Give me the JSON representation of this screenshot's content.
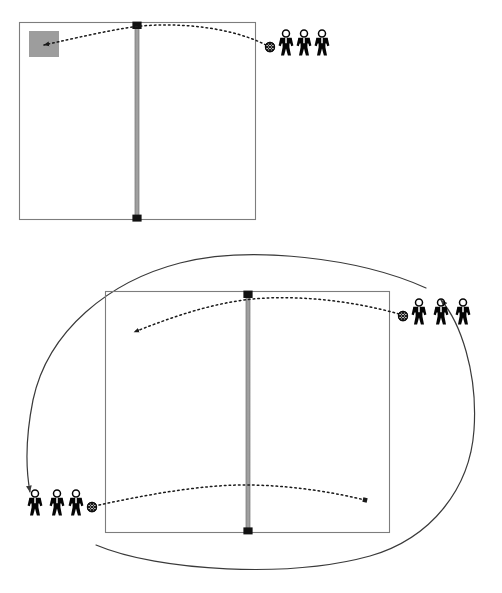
{
  "document": {
    "type": "sports-drill-diagram",
    "sport": "volleyball",
    "title_fragment_top": "",
    "caption_fragment_bottom": ""
  },
  "palette": {
    "court_line": "#7d7d7d",
    "net_band": "#9a9a9a",
    "net_post": "#111111",
    "target_zone": "#9d9d9d",
    "trajectory": "#1a1a1a",
    "rotation_arrow": "#3a3a3a",
    "figure": "#050505",
    "background": "#ffffff"
  },
  "diagrams": [
    {
      "id": "diagram-top",
      "name": "top-drill-diagram",
      "court": {
        "x": 19,
        "y": 22,
        "width": 237,
        "height": 198
      },
      "net": {
        "x": 137,
        "top": 22,
        "bottom": 220
      },
      "target_zone": {
        "label": "target-zone",
        "x": 29,
        "y": 31,
        "width": 30,
        "height": 26
      },
      "ball_count": 1,
      "player_groups": [
        {
          "name": "server-group-right",
          "players": 3,
          "x": 279,
          "y": 32,
          "ball_side": "left",
          "ball": {
            "x": 270,
            "y": 47
          }
        }
      ],
      "trajectories": [
        {
          "name": "serve-to-target",
          "from": "ball-right",
          "to": "target-zone",
          "style": "dotted",
          "arrowhead": "end"
        }
      ],
      "rotation_arrows": []
    },
    {
      "id": "diagram-bottom",
      "name": "bottom-drill-diagram",
      "court": {
        "x": 105,
        "y": 291,
        "width": 285,
        "height": 242
      },
      "net": {
        "x": 248,
        "top": 291,
        "bottom": 533
      },
      "ball_count": 2,
      "player_groups": [
        {
          "name": "server-group-right",
          "players": 3,
          "x": 412,
          "y": 300,
          "ball_side": "left",
          "ball": {
            "x": 403,
            "y": 316
          }
        },
        {
          "name": "server-group-left",
          "players": 3,
          "x": 26,
          "y": 492,
          "ball_side": "right",
          "ball": {
            "x": 92,
            "y": 507
          }
        }
      ],
      "trajectories": [
        {
          "name": "serve-right-to-left-court",
          "from": "ball-right",
          "to": "left-court-landing",
          "style": "dotted",
          "arrowhead": "end"
        },
        {
          "name": "serve-left-to-right-court",
          "from": "ball-left",
          "to": "right-court-landing",
          "style": "dotted",
          "arrowhead": "end"
        }
      ],
      "rotation_arrows": [
        {
          "name": "rotation-right-to-left",
          "direction": "counter-clockwise",
          "from": "right-group",
          "to": "left-group",
          "arrowhead": "end"
        },
        {
          "name": "rotation-left-to-right",
          "direction": "counter-clockwise",
          "from": "left-group",
          "to": "right-group",
          "arrowhead": "end"
        }
      ]
    }
  ]
}
